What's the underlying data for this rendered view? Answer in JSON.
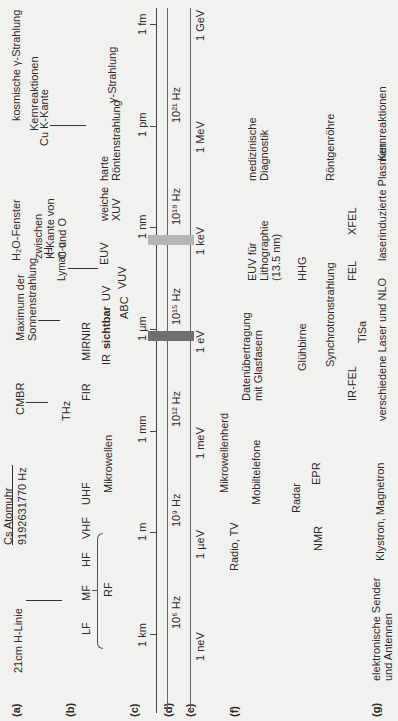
{
  "rows": {
    "a": "(a)",
    "b": "(b)",
    "c": "(c)",
    "d": "(d)",
    "e": "(e)",
    "f": "(f)",
    "g": "(g)"
  },
  "row_a": {
    "h_line": "21cm H-Linie",
    "cs_clock": "Cs Atomuhr",
    "cs_freq": "9192631770 Hz",
    "cmbr": "CMBR",
    "sun_max_1": "Maximum der",
    "sun_max_2": "Sonnenstrahlung",
    "lyman_h": "H",
    "lyman_a": "Lyman-α",
    "h2o_window": "H₂O-Fenster",
    "h2o_desc_1": "zwischen",
    "h2o_desc_2": "K-Kante von",
    "h2o_desc_3": "C und O",
    "cu_k": "Cu K-Kante",
    "nuclear": "Kernreaktionen",
    "cosmic_gamma": "kosmische γ-Strahlung"
  },
  "row_b": {
    "lf": "LF",
    "mf": "MF",
    "hf": "HF",
    "vhf": "VHF",
    "uhf": "UHF",
    "rf": "RF",
    "microwaves": "Mikrowellen",
    "thz": "THz",
    "fir": "FIR",
    "mir": "MIR",
    "nir": "NIR",
    "ir": "IR",
    "visible": "sichtbar",
    "uv": "UV",
    "abc": "ABC",
    "vuv": "VUV",
    "euv": "EUV",
    "soft_xuv_1": "weiche",
    "soft_xuv_2": "XUV",
    "dash": "-",
    "hard_xray_1": "harte",
    "hard_xray_2": "Röntenstrahlung",
    "gamma": "γ-Strahlung"
  },
  "axis_c": {
    "ticks": [
      "1 km",
      "1 m",
      "1 mm",
      "1 µm",
      "1 nm",
      "1 pm",
      "1 fm"
    ]
  },
  "axis_d": {
    "ticks": [
      "10⁶ Hz",
      "10⁹ Hz",
      "10¹² Hz",
      "10¹⁵ Hz",
      "10¹⁸ Hz",
      "10²¹ Hz"
    ]
  },
  "axis_e": {
    "ticks": [
      "1 neV",
      "1 µeV",
      "1 meV",
      "1 eV",
      "1 keV",
      "1 MeV",
      "1 GeV"
    ]
  },
  "row_f": {
    "radio_tv": "Radio, TV",
    "mobile": "Mobiltelefone",
    "microwave_oven": "Mikrowellenherd",
    "radar": "Radar",
    "nmr": "NMR",
    "epr": "EPR",
    "fiber_1": "Datenübertragung",
    "fiber_2": "mit Glasfasern",
    "euv_litho_1": "EUV für",
    "euv_litho_2": "Lithographie",
    "euv_litho_3": "(13.5 nm)",
    "medical_1": "medizinische",
    "medical_2": "Diagnostik"
  },
  "row_g": {
    "electronic_1": "elektronische Sender",
    "electronic_2": "und Antennen",
    "klystron": "Klystron, Magnetron",
    "lasers": "verschiedene Laser und NLO",
    "laser_plasma": "laserinduzierte Plasmen",
    "nuclear": "Kernreaktionen",
    "glow": "Glühbirne",
    "synchrotron": "Synchrotronstrahlung",
    "hhg": "HHG",
    "xray_tube": "Röntgenröhre",
    "ir_fel": "IR-FEL",
    "tisa": "TiSa",
    "fel": "FEL",
    "xfel": "XFEL"
  },
  "colors": {
    "background": "#f1f1ef",
    "axis": "#444444",
    "visible_band": "#6f6f6f",
    "water_window_band": "#b5b5b5",
    "text": "#2a2a2a"
  }
}
